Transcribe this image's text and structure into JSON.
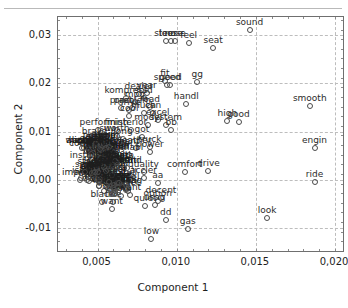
{
  "chart_data": {
    "type": "scatter",
    "title": "",
    "xlabel": "Component 1",
    "ylabel": "Component 2",
    "xlim": [
      0.0025,
      0.0205
    ],
    "ylim": [
      -0.0148,
      0.0338
    ],
    "xticks": [
      0.005,
      0.01,
      0.015,
      0.02
    ],
    "xticklabels": [
      "0,005",
      "0,010",
      "0,015",
      "0,020"
    ],
    "yticks": [
      -0.01,
      0.0,
      0.01,
      0.02,
      0.03
    ],
    "yticklabels": [
      "-0,01",
      "0,00",
      "0,01",
      "0,02",
      "0,03"
    ],
    "grid": true,
    "legend": null,
    "decimal_separator": ",",
    "points": [
      {
        "label": "sound",
        "x": 0.0146,
        "y": 0.0311
      },
      {
        "label": "steer",
        "x": 0.0093,
        "y": 0.0288
      },
      {
        "label": "loose",
        "x": 0.00965,
        "y": 0.0288
      },
      {
        "label": "nose",
        "x": 0.0099,
        "y": 0.0288
      },
      {
        "label": "feel",
        "x": 0.01075,
        "y": 0.0284
      },
      {
        "label": "seat",
        "x": 0.0123,
        "y": 0.0273
      },
      {
        "label": "fit",
        "x": 0.00925,
        "y": 0.0206
      },
      {
        "label": "gg",
        "x": 0.0113,
        "y": 0.0203
      },
      {
        "label": "speed",
        "x": 0.0094,
        "y": 0.0197
      },
      {
        "label": "good",
        "x": 0.0096,
        "y": 0.0197
      },
      {
        "label": "dealer",
        "x": 0.0076,
        "y": 0.0179
      },
      {
        "label": "year",
        "x": 0.0081,
        "y": 0.018
      },
      {
        "label": "kompress",
        "x": 0.0068,
        "y": 0.0169
      },
      {
        "label": "sold",
        "x": 0.0079,
        "y": 0.0169
      },
      {
        "label": "mpg",
        "x": 0.00735,
        "y": 0.0161
      },
      {
        "label": "handl",
        "x": 0.0106,
        "y": 0.0157
      },
      {
        "label": "smooth",
        "x": 0.0184,
        "y": 0.0153
      },
      {
        "label": "pract",
        "x": 0.0065,
        "y": 0.015
      },
      {
        "label": "road",
        "x": 0.0083,
        "y": 0.0151
      },
      {
        "label": "problem",
        "x": 0.0072,
        "y": 0.0149
      },
      {
        "label": "drive",
        "x": 0.007,
        "y": 0.0144
      },
      {
        "label": "much",
        "x": 0.0079,
        "y": 0.0139
      },
      {
        "label": "can",
        "x": 0.0085,
        "y": 0.0139
      },
      {
        "label": "cool",
        "x": 0.007,
        "y": 0.0133
      },
      {
        "label": "excel",
        "x": 0.0088,
        "y": 0.0125
      },
      {
        "label": "high",
        "x": 0.0132,
        "y": 0.0123
      },
      {
        "label": "good2",
        "x": 0.0139,
        "y": 0.012
      },
      {
        "label": "model",
        "x": 0.0082,
        "y": 0.0113
      },
      {
        "label": "system",
        "x": 0.0093,
        "y": 0.0114
      },
      {
        "label": "perform",
        "x": 0.005,
        "y": 0.0104
      },
      {
        "label": "finish",
        "x": 0.0062,
        "y": 0.0104
      },
      {
        "label": "interior",
        "x": 0.0071,
        "y": 0.0104
      },
      {
        "label": "bb",
        "x": 0.00965,
        "y": 0.0103
      },
      {
        "label": "suv",
        "x": 0.0056,
        "y": 0.009
      },
      {
        "label": "worth",
        "x": 0.0062,
        "y": 0.009
      },
      {
        "label": "got",
        "x": 0.0078,
        "y": 0.0088
      },
      {
        "label": "brake",
        "x": 0.0048,
        "y": 0.0085
      },
      {
        "label": "long",
        "x": 0.0066,
        "y": 0.0084
      },
      {
        "label": "engin",
        "x": 0.0187,
        "y": 0.0066
      },
      {
        "label": "appear",
        "x": 0.004,
        "y": 0.0066
      },
      {
        "label": "truck",
        "x": 0.0083,
        "y": 0.0069
      },
      {
        "label": "leather",
        "x": 0.0074,
        "y": 0.0065
      },
      {
        "label": "power",
        "x": 0.0083,
        "y": 0.0058
      },
      {
        "label": "comfort",
        "x": 0.0043,
        "y": 0.0059
      },
      {
        "label": "reliabl",
        "x": 0.007,
        "y": 0.0052
      },
      {
        "label": "option",
        "x": 0.0061,
        "y": 0.0054
      },
      {
        "label": "instrument",
        "x": 0.0048,
        "y": 0.0034
      },
      {
        "label": "great",
        "x": 0.0062,
        "y": 0.0035
      },
      {
        "label": "quality",
        "x": 0.0079,
        "y": 0.0016
      },
      {
        "label": "comfort2",
        "x": 0.0105,
        "y": 0.0017
      },
      {
        "label": "drive2",
        "x": 0.012,
        "y": 0.0018
      },
      {
        "label": "ride",
        "x": 0.0187,
        "y": -0.0004
      },
      {
        "label": "accler",
        "x": 0.0079,
        "y": 0.0004
      },
      {
        "label": "aa",
        "x": 0.0088,
        "y": -0.0006
      },
      {
        "label": "rib",
        "x": 0.0054,
        "y": -0.0024
      },
      {
        "label": "right",
        "x": 0.0061,
        "y": -0.0023
      },
      {
        "label": "ph",
        "x": 0.0069,
        "y": -0.0023
      },
      {
        "label": "decent",
        "x": 0.009,
        "y": -0.0038
      },
      {
        "label": "option2",
        "x": 0.0088,
        "y": -0.0045
      },
      {
        "label": "black",
        "x": 0.0053,
        "y": -0.0047
      },
      {
        "label": "line",
        "x": 0.006,
        "y": -0.0047
      },
      {
        "label": "want",
        "x": 0.0059,
        "y": -0.006
      },
      {
        "label": "quiet",
        "x": 0.008,
        "y": -0.0054
      },
      {
        "label": "usag",
        "x": 0.0086,
        "y": -0.0053
      },
      {
        "label": "dd",
        "x": 0.0093,
        "y": -0.0084
      },
      {
        "label": "look",
        "x": 0.0157,
        "y": -0.008
      },
      {
        "label": "gas",
        "x": 0.0107,
        "y": -0.0102
      },
      {
        "label": "low",
        "x": 0.0084,
        "y": -0.0124
      }
    ],
    "cluster_note": "dense overlapping cluster of term labels on the left side"
  }
}
